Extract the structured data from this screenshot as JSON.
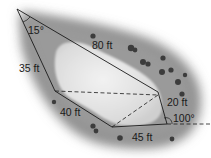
{
  "diagram": {
    "type": "land-plot-polygon",
    "labels": {
      "angle_top": "15°",
      "side_top": "80 ft",
      "side_left_upper": "35 ft",
      "side_left_lower": "40 ft",
      "side_right": "20 ft",
      "angle_bottom_right": "100°",
      "side_bottom": "45 ft"
    },
    "colors": {
      "ground": "#8a8a8a",
      "pond": "#e6e6e6",
      "lines": "#1a1a1a",
      "shrubs": "#3a3a3a"
    }
  }
}
